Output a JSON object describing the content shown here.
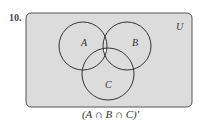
{
  "problem_number": "10.",
  "universe_label": "U",
  "sets": [
    {
      "label": "A"
    },
    {
      "label": "B"
    },
    {
      "label": "C"
    }
  ],
  "caption": "(A ∩ B ∩ C)′",
  "colors": {
    "shaded": "#dcdcdc",
    "unshaded": "#ffffff",
    "stroke": "#333333"
  }
}
